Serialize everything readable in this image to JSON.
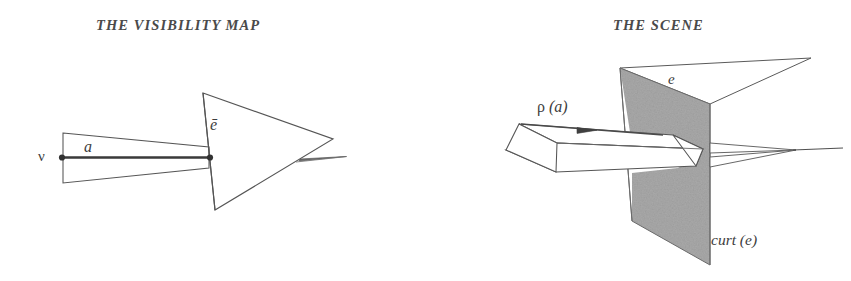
{
  "figure": {
    "domain": "Diagram",
    "background_color": "#ffffff",
    "ink_color": "#4a4a4a",
    "gray_fill_color": "#a8a8a8",
    "panels": [
      {
        "id": "visibility-map",
        "title": "THE VISIBILITY MAP",
        "labels": {
          "vertex": "ν",
          "arc": "a",
          "edge_bar": "ē"
        }
      },
      {
        "id": "scene",
        "title": "THE SCENE",
        "labels": {
          "beam": "ρ (a)",
          "beam_greek": "ρ",
          "beam_arg": " (a)",
          "edge": "e",
          "curtain": "curt (e)"
        }
      }
    ]
  }
}
